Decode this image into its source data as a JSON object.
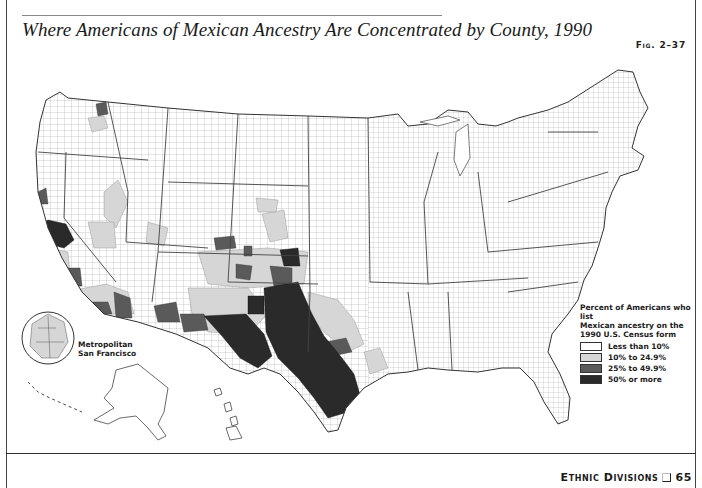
{
  "header": {
    "title": "Where Americans of Mexican Ancestry Are Concentrated by County, 1990",
    "figure_label": "Fig. 2–37"
  },
  "map": {
    "subject": "Percent of Americans who list Mexican ancestry on the 1990 U.S. Census form, by county",
    "inset": {
      "label_line1": "Metropolitan",
      "label_line2": "San Francisco"
    },
    "regions_shown": [
      "Contiguous United States",
      "Alaska",
      "Hawaii",
      "Metropolitan San Francisco inset"
    ]
  },
  "legend": {
    "title_line1": "Percent of Americans who list",
    "title_line2": "Mexican ancestry on the",
    "title_line3": "1990 U.S. Census form",
    "items": [
      {
        "label": "Less than 10%",
        "color": "#ffffff"
      },
      {
        "label": "10% to 24.9%",
        "color": "#d6d6d6"
      },
      {
        "label": "25% to 49.9%",
        "color": "#5a5a5a"
      },
      {
        "label": "50% or more",
        "color": "#2a2a2a"
      }
    ]
  },
  "footer": {
    "section": "Ethnic Divisions",
    "page_number": "65"
  }
}
